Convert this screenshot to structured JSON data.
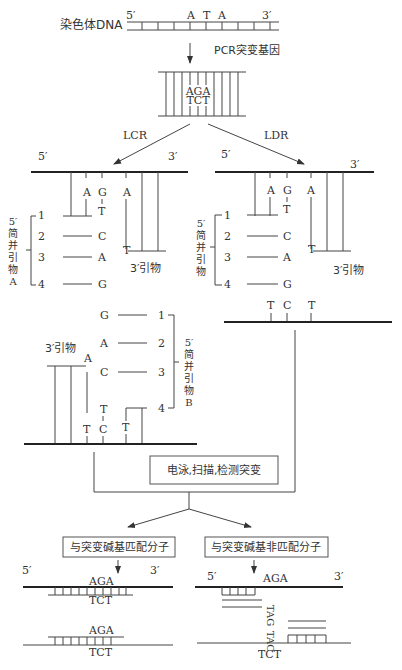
{
  "top": {
    "label": "染色体DNA",
    "five": "5′",
    "three": "3′",
    "bases": [
      "A",
      "T",
      "A"
    ],
    "step": "PCR突变基因"
  },
  "pcr_product": {
    "top": "AGA",
    "bottom": "TCT"
  },
  "branches": {
    "left": "LCR",
    "right": "LDR"
  },
  "lcr": {
    "five": "5′",
    "three": "3′",
    "template_bases": [
      "A",
      "G",
      "A"
    ],
    "primer_end": "T",
    "primer_group_label": [
      "5′",
      "简",
      "并",
      "引",
      "物",
      "A"
    ],
    "primer_numbers": [
      "1",
      "2",
      "3",
      "4"
    ],
    "primer_bases": [
      "T",
      "C",
      "A",
      "G"
    ],
    "three_primer": "3′引物",
    "three_primer_end": "T"
  },
  "ldr": {
    "five": "5′",
    "three": "3′",
    "template_bases": [
      "A",
      "G",
      "A"
    ],
    "primer_end": "T",
    "primer_group_label": [
      "5′",
      "简",
      "并",
      "引",
      "物"
    ],
    "primer_numbers": [
      "1",
      "2",
      "3",
      "4"
    ],
    "primer_bases": [
      "T",
      "C",
      "A",
      "G"
    ],
    "three_primer": "3′引物",
    "three_primer_end": "T",
    "bottom_bases": [
      "T",
      "C",
      "T"
    ]
  },
  "lcr2": {
    "primer_bases": [
      "G",
      "A",
      "C",
      "T"
    ],
    "primer_numbers": [
      "1",
      "2",
      "3",
      "4"
    ],
    "primer_group_label": [
      "5′",
      "简",
      "并",
      "引",
      "物",
      "B"
    ],
    "three_primer": "3′引物",
    "three_primer_end": "A",
    "bottom_bases": [
      "T",
      "C",
      "T"
    ]
  },
  "detect_box": "电泳,扫描,检测突变",
  "match": {
    "label": "与突变碱基匹配分子",
    "five": "5′",
    "three": "3′",
    "upper": {
      "top": "AGA",
      "bottom": "TCT"
    },
    "lower": {
      "top": "AGA",
      "bottom": "TCT"
    }
  },
  "mismatch": {
    "label": "与突变碱基非匹配分子",
    "five": "5′",
    "three": "3′",
    "top_seq": "AGA",
    "vertical1": "TAG",
    "vertical2": "TAC",
    "bottom_seq": "TCT"
  }
}
